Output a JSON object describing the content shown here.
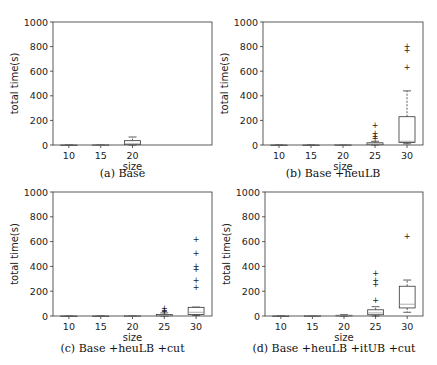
{
  "figure": {
    "panels": [
      {
        "id": "a",
        "caption": "(a) Base"
      },
      {
        "id": "b",
        "caption": "(b) Base +heuLB"
      },
      {
        "id": "c",
        "caption": "(c) Base +heuLB +cut"
      },
      {
        "id": "d",
        "caption": "(d) Base +heuLB +itUB +cut"
      }
    ]
  },
  "chart_data": [
    {
      "type": "box",
      "title": "(a) Base",
      "xlabel": "size",
      "ylabel": "total time(s)",
      "ylim": [
        0,
        1000
      ],
      "yticks": [
        0,
        200,
        400,
        600,
        800,
        1000
      ],
      "categories": [
        "10",
        "15",
        "20"
      ],
      "xlim_categories": [
        "10",
        "15",
        "20",
        "25",
        "30"
      ],
      "boxes": [
        {
          "x": "10",
          "q1": 0,
          "median": 0,
          "q3": 0,
          "whisker_low": 0,
          "whisker_high": 0,
          "outliers": []
        },
        {
          "x": "15",
          "q1": 0,
          "median": 0,
          "q3": 1,
          "whisker_low": 0,
          "whisker_high": 2,
          "outliers": []
        },
        {
          "x": "20",
          "q1": 3,
          "median": 10,
          "q3": 35,
          "whisker_low": 0,
          "whisker_high": 65,
          "outliers": []
        }
      ]
    },
    {
      "type": "box",
      "title": "(b) Base +heuLB",
      "xlabel": "size",
      "ylabel": "total time(s)",
      "ylim": [
        0,
        1000
      ],
      "yticks": [
        0,
        200,
        400,
        600,
        800,
        1000
      ],
      "categories": [
        "10",
        "15",
        "20",
        "25",
        "30"
      ],
      "boxes": [
        {
          "x": "10",
          "q1": 0,
          "median": 0,
          "q3": 0,
          "whisker_low": 0,
          "whisker_high": 0,
          "outliers": []
        },
        {
          "x": "15",
          "q1": 0,
          "median": 0,
          "q3": 0,
          "whisker_low": 0,
          "whisker_high": 1,
          "outliers": []
        },
        {
          "x": "20",
          "q1": 0,
          "median": 1,
          "q3": 2,
          "whisker_low": 0,
          "whisker_high": 4,
          "outliers": []
        },
        {
          "x": "25",
          "q1": 3,
          "median": 8,
          "q3": 18,
          "whisker_low": 0,
          "whisker_high": 30,
          "outliers": [
            60,
            75,
            100,
            165
          ]
        },
        {
          "x": "30",
          "q1": 20,
          "median": 30,
          "q3": 230,
          "whisker_low": 10,
          "whisker_high": 440,
          "outliers": [
            635,
            775,
            805
          ]
        }
      ]
    },
    {
      "type": "box",
      "title": "(c) Base +heuLB +cut",
      "xlabel": "size",
      "ylabel": "total time(s)",
      "ylim": [
        0,
        1000
      ],
      "yticks": [
        0,
        200,
        400,
        600,
        800,
        1000
      ],
      "categories": [
        "10",
        "15",
        "20",
        "25",
        "30"
      ],
      "boxes": [
        {
          "x": "10",
          "q1": 0,
          "median": 0,
          "q3": 0,
          "whisker_low": 0,
          "whisker_high": 0,
          "outliers": []
        },
        {
          "x": "15",
          "q1": 0,
          "median": 0,
          "q3": 0,
          "whisker_low": 0,
          "whisker_high": 1,
          "outliers": []
        },
        {
          "x": "20",
          "q1": 0,
          "median": 0,
          "q3": 1,
          "whisker_low": 0,
          "whisker_high": 3,
          "outliers": []
        },
        {
          "x": "25",
          "q1": 2,
          "median": 5,
          "q3": 12,
          "whisker_low": 0,
          "whisker_high": 25,
          "outliers": [
            40,
            50,
            65
          ]
        },
        {
          "x": "30",
          "q1": 12,
          "median": 30,
          "q3": 70,
          "whisker_low": 5,
          "whisker_high": 72,
          "outliers": [
            235,
            290,
            380,
            400,
            510,
            620
          ]
        }
      ]
    },
    {
      "type": "box",
      "title": "(d) Base +heuLB +itUB +cut",
      "xlabel": "size",
      "ylabel": "total time(s)",
      "ylim": [
        0,
        1000
      ],
      "yticks": [
        0,
        200,
        400,
        600,
        800,
        1000
      ],
      "categories": [
        "10",
        "15",
        "20",
        "25",
        "30"
      ],
      "boxes": [
        {
          "x": "10",
          "q1": 0,
          "median": 0,
          "q3": 0,
          "whisker_low": 0,
          "whisker_high": 0,
          "outliers": []
        },
        {
          "x": "15",
          "q1": 0,
          "median": 1,
          "q3": 2,
          "whisker_low": 0,
          "whisker_high": 4,
          "outliers": []
        },
        {
          "x": "20",
          "q1": 1,
          "median": 3,
          "q3": 6,
          "whisker_low": 0,
          "whisker_high": 10,
          "outliers": []
        },
        {
          "x": "25",
          "q1": 10,
          "median": 25,
          "q3": 50,
          "whisker_low": 0,
          "whisker_high": 75,
          "outliers": [
            130,
            260,
            290,
            350
          ]
        },
        {
          "x": "30",
          "q1": 65,
          "median": 95,
          "q3": 240,
          "whisker_low": 30,
          "whisker_high": 290,
          "outliers": [
            645
          ]
        }
      ]
    }
  ],
  "layout": {
    "panel_boxes": [
      {
        "left": 53,
        "top": 22,
        "right": 212,
        "bottom": 145,
        "cap_y": 177
      },
      {
        "left": 263,
        "top": 22,
        "right": 423,
        "bottom": 145,
        "cap_y": 177
      },
      {
        "left": 53,
        "top": 192,
        "right": 212,
        "bottom": 316,
        "cap_y": 352
      },
      {
        "left": 265,
        "top": 192,
        "right": 423,
        "bottom": 316,
        "cap_y": 352
      }
    ]
  }
}
